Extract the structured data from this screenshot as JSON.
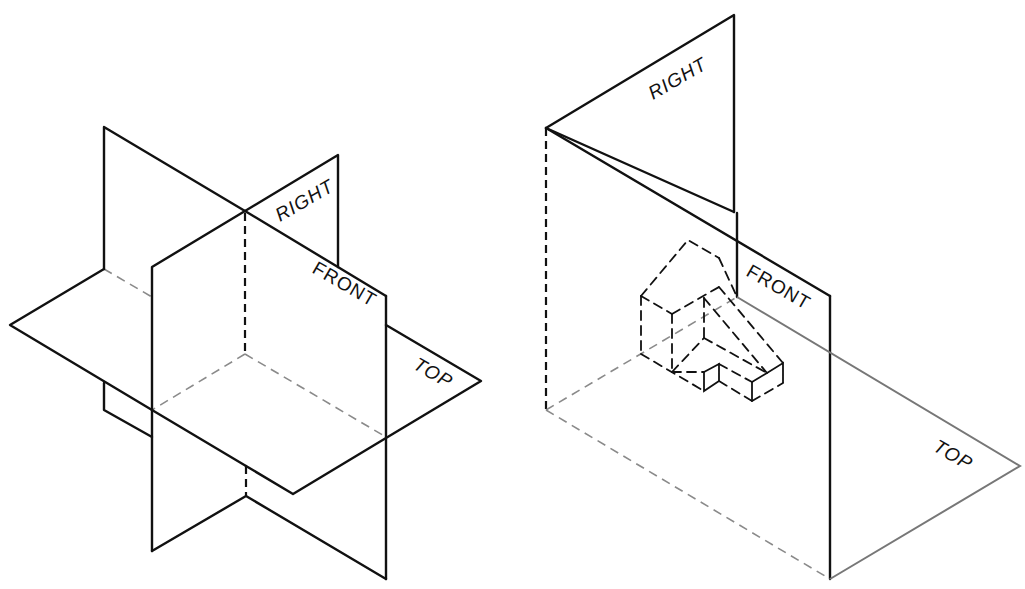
{
  "figures": [
    {
      "id": "intersecting-planes",
      "description": "Three mutually perpendicular intersecting projection planes (isometric)",
      "labels": {
        "right": "RIGHT",
        "front": "FRONT",
        "top": "TOP"
      }
    },
    {
      "id": "first-octant-with-object",
      "description": "Projection planes forming a corner with a hidden stepped object inside",
      "labels": {
        "right": "RIGHT",
        "front": "FRONT",
        "top": "TOP"
      }
    }
  ]
}
